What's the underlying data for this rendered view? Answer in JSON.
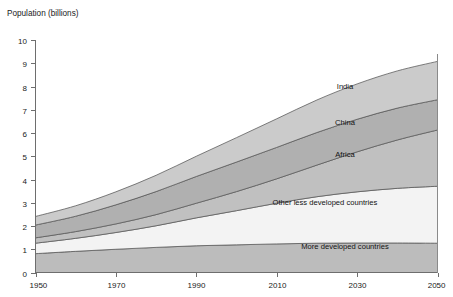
{
  "chart_data": {
    "type": "area",
    "title": "Population (billions)",
    "xlabel": "",
    "ylabel": "Population (billions)",
    "stacked": true,
    "grid": false,
    "legend_position": "inline-labels",
    "xlim": [
      1950,
      2050
    ],
    "ylim": [
      0,
      10
    ],
    "yticks": [
      0,
      1,
      2,
      3,
      4,
      5,
      6,
      7,
      8,
      9,
      10
    ],
    "ytick_labels": [
      "0",
      "1",
      "2",
      "3",
      "4",
      "5",
      "6",
      "7",
      "8",
      "9",
      "10"
    ],
    "xticks": [
      1950,
      1970,
      1990,
      2010,
      2030,
      2050
    ],
    "xtick_labels": [
      "1950",
      "1970",
      "1990",
      "2010",
      "2030",
      "2050"
    ],
    "x": [
      1950,
      1960,
      1970,
      1980,
      1990,
      2000,
      2010,
      2020,
      2030,
      2040,
      2050
    ],
    "series": [
      {
        "name": "More developed countries",
        "label": "More developed countries",
        "color": "#bcbcbc",
        "values": [
          0.81,
          0.91,
          1.0,
          1.08,
          1.15,
          1.19,
          1.23,
          1.26,
          1.27,
          1.27,
          1.26
        ]
      },
      {
        "name": "Other less developed countries",
        "label": "Other less developed countries",
        "color": "#f3f3f3",
        "values": [
          0.45,
          0.56,
          0.72,
          0.93,
          1.2,
          1.47,
          1.75,
          2.0,
          2.2,
          2.35,
          2.45
        ]
      },
      {
        "name": "Africa",
        "label": "Africa",
        "color": "#c0c0c0",
        "values": [
          0.23,
          0.29,
          0.37,
          0.48,
          0.63,
          0.82,
          1.05,
          1.36,
          1.72,
          2.08,
          2.42
        ]
      },
      {
        "name": "China",
        "label": "China",
        "color": "#b0b0b0",
        "values": [
          0.55,
          0.66,
          0.82,
          0.99,
          1.15,
          1.27,
          1.35,
          1.4,
          1.4,
          1.37,
          1.3
        ]
      },
      {
        "name": "India",
        "label": "India",
        "color": "#cbcbcb",
        "values": [
          0.37,
          0.45,
          0.56,
          0.7,
          0.87,
          1.05,
          1.23,
          1.4,
          1.52,
          1.6,
          1.65
        ]
      }
    ],
    "totals": [
      2.41,
      2.87,
      3.47,
      4.18,
      5.0,
      5.8,
      6.61,
      7.42,
      8.11,
      8.67,
      9.08
    ],
    "band_label_points": [
      {
        "name": "India",
        "x": 2027,
        "y": 7.9
      },
      {
        "name": "China",
        "x": 2027,
        "y": 6.35
      },
      {
        "name": "Africa",
        "x": 2027,
        "y": 4.95
      },
      {
        "name": "Other less developed countries",
        "x": 2022,
        "y": 2.9
      },
      {
        "name": "More developed countries",
        "x": 2027,
        "y": 1.0
      }
    ]
  },
  "colors": {
    "axis": "#6e6e6e",
    "text": "#1a1a1a",
    "band_stroke": "#5d5d5d",
    "background": "#ffffff"
  }
}
